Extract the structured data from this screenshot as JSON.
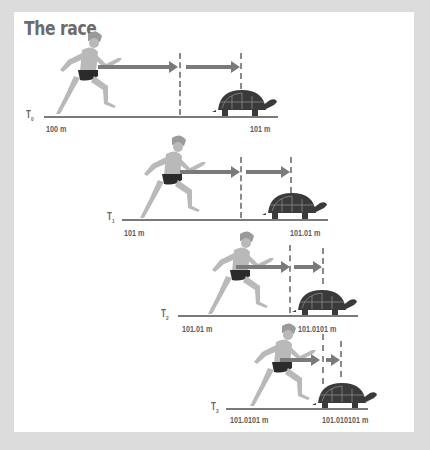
{
  "title": "The race",
  "colors": {
    "background": "#dcdcdc",
    "panel": "#ffffff",
    "title": "#6b6b6b",
    "lines": "#7a7a7a",
    "runner_body": "#b9b9b9",
    "runner_shorts": "#2b2b2b",
    "tortoise": "#3a3a3a"
  },
  "stages": [
    {
      "time_label": "T",
      "time_sub": "0",
      "runner_position": "100 m",
      "tortoise_position": "101 m"
    },
    {
      "time_label": "T",
      "time_sub": "1",
      "runner_position": "101 m",
      "tortoise_position": "101.01 m"
    },
    {
      "time_label": "T",
      "time_sub": "2",
      "runner_position": "101.01 m",
      "tortoise_position": "101.0101 m"
    },
    {
      "time_label": "T",
      "time_sub": "3",
      "runner_position": "101.0101 m",
      "tortoise_position": "101.010101 m"
    }
  ]
}
